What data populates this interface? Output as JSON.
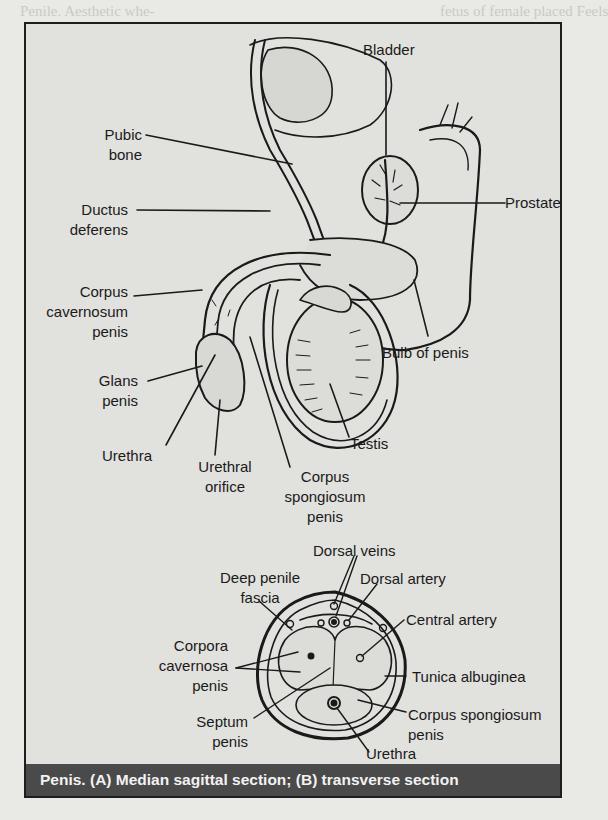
{
  "figure": {
    "caption": "Penis. (A) Median sagittal section; (B) transverse section",
    "colors": {
      "page_bg": "#e9e9e6",
      "frame_bg": "#e1e1de",
      "caption_bg": "#4a4a4a",
      "caption_text": "#f2f2f2",
      "line": "#1a1a1a"
    },
    "sagittal_labels": {
      "bladder": "Bladder",
      "pubic_bone_1": "Pubic",
      "pubic_bone_2": "bone",
      "ductus_1": "Ductus",
      "ductus_2": "deferens",
      "prostate": "Prostate",
      "cc_1": "Corpus",
      "cc_2": "cavernosum",
      "cc_3": "penis",
      "glans_1": "Glans",
      "glans_2": "penis",
      "bulb": "Bulb of penis",
      "testis": "Testis",
      "urethra": "Urethra",
      "orifice_1": "Urethral",
      "orifice_2": "orifice",
      "cs_1": "Corpus",
      "cs_2": "spongiosum",
      "cs_3": "penis"
    },
    "transverse_labels": {
      "dorsal_veins": "Dorsal veins",
      "dorsal_artery": "Dorsal artery",
      "deep_fascia_1": "Deep penile",
      "deep_fascia_2": "fascia",
      "central_artery": "Central artery",
      "corpora_1": "Corpora",
      "corpora_2": "cavernosa",
      "corpora_3": "penis",
      "tunica": "Tunica albuginea",
      "cs_1": "Corpus spongiosum",
      "cs_2": "penis",
      "septum_1": "Septum",
      "septum_2": "penis",
      "urethra": "Urethra"
    }
  }
}
